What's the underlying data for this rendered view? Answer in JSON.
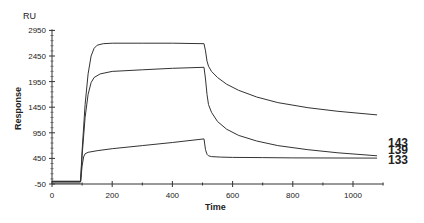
{
  "chart_data": {
    "type": "line",
    "title": "",
    "xlabel": "Time",
    "ylabel": "Response",
    "yunit": "RU",
    "xlim": [
      0,
      1100
    ],
    "ylim": [
      -50,
      2950
    ],
    "xticks": [
      0,
      200,
      400,
      600,
      800,
      1000
    ],
    "yticks": [
      -50,
      450,
      950,
      1450,
      1950,
      2450,
      2950
    ],
    "grid": false,
    "legend": "inline labels at right end of curves",
    "series": [
      {
        "name": "143",
        "x": [
          0,
          95,
          100,
          110,
          120,
          130,
          140,
          150,
          170,
          200,
          300,
          400,
          505,
          510,
          515,
          520,
          530,
          550,
          580,
          620,
          680,
          750,
          850,
          950,
          1080
        ],
        "values": [
          0,
          0,
          600,
          1500,
          2100,
          2450,
          2600,
          2660,
          2690,
          2700,
          2700,
          2700,
          2690,
          2550,
          2350,
          2250,
          2150,
          2030,
          1900,
          1780,
          1650,
          1540,
          1440,
          1370,
          1300
        ]
      },
      {
        "name": "139",
        "x": [
          0,
          95,
          100,
          110,
          120,
          130,
          140,
          160,
          200,
          300,
          400,
          505,
          510,
          515,
          520,
          530,
          550,
          580,
          620,
          680,
          750,
          850,
          950,
          1080
        ],
        "values": [
          0,
          0,
          500,
          1250,
          1700,
          1930,
          2030,
          2100,
          2150,
          2180,
          2210,
          2230,
          2000,
          1700,
          1500,
          1350,
          1170,
          1020,
          900,
          790,
          700,
          620,
          560,
          500
        ]
      },
      {
        "name": "133",
        "x": [
          0,
          95,
          100,
          105,
          110,
          120,
          150,
          200,
          300,
          400,
          505,
          510,
          515,
          520,
          530,
          560,
          600,
          700,
          800,
          1080
        ],
        "values": [
          0,
          0,
          300,
          480,
          540,
          570,
          600,
          640,
          700,
          760,
          830,
          620,
          530,
          500,
          485,
          475,
          470,
          465,
          460,
          455
        ]
      }
    ]
  },
  "labels": {
    "y_unit": "RU",
    "y_title": "Response",
    "x_title": "Time",
    "series_labels": [
      "143",
      "139",
      "133"
    ]
  }
}
